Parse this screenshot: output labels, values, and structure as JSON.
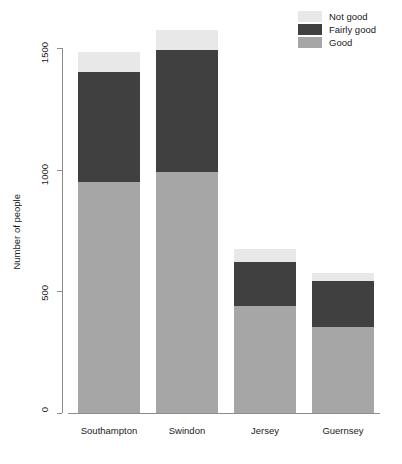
{
  "chart_data": {
    "type": "bar",
    "stacked": true,
    "title": "",
    "xlabel": "",
    "ylabel": "Number of people",
    "categories": [
      "Southampton",
      "Swindon",
      "Jersey",
      "Guernsey"
    ],
    "series": [
      {
        "name": "Good",
        "color": "#a6a6a6",
        "values": [
          950,
          990,
          440,
          353
        ]
      },
      {
        "name": "Fairly good",
        "color": "#404040",
        "values": [
          450,
          500,
          180,
          190
        ]
      },
      {
        "name": "Not good",
        "color": "#e8e8e8",
        "values": [
          85,
          85,
          55,
          33
        ]
      }
    ],
    "totals": [
      1485,
      1575,
      675,
      576
    ],
    "ylim": [
      0,
      1500
    ],
    "y_ticks": [
      0,
      500,
      1000,
      1500
    ],
    "y_tick_labels": [
      "0",
      "500",
      "1000",
      "1500"
    ],
    "grid": false,
    "legend": {
      "position": "top-right",
      "entries": [
        {
          "label": "Not good",
          "color": "#e8e8e8"
        },
        {
          "label": "Fairly good",
          "color": "#404040"
        },
        {
          "label": "Good",
          "color": "#a6a6a6"
        }
      ]
    },
    "axis_color": "#8d8d8d",
    "background": "#ffffff"
  }
}
